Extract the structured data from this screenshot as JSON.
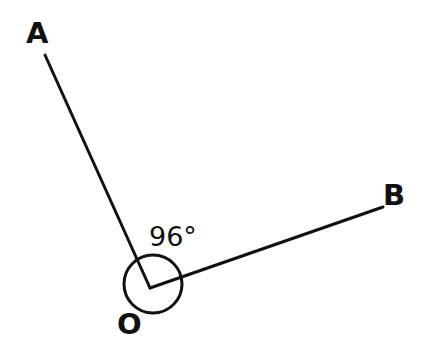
{
  "figure": {
    "background_color": "#ffffff",
    "stroke_color": "#111111",
    "stroke_width": 3,
    "width": 427,
    "height": 362
  },
  "labels": {
    "point_a": "A",
    "point_b": "B",
    "vertex_o": "O",
    "angle_measure": "96°"
  },
  "chart_data": {
    "type": "diagram",
    "subtype": "angle",
    "angle_degrees": 96,
    "angle_label": "96°",
    "vertex": {
      "name": "O",
      "x": 150,
      "y": 288
    },
    "points": [
      {
        "name": "A",
        "x": 45,
        "y": 55,
        "label_x": 33,
        "label_y": 38
      },
      {
        "name": "B",
        "x": 383,
        "y": 207,
        "label_x": 392,
        "label_y": 198
      }
    ],
    "rays": [
      {
        "name": "OA",
        "from": "O",
        "to": "A",
        "x1": 150,
        "y1": 288,
        "x2": 45,
        "y2": 55
      },
      {
        "name": "OB",
        "from": "O",
        "to": "B",
        "x1": 150,
        "y1": 288,
        "x2": 383,
        "y2": 207
      }
    ],
    "vertex_marker": {
      "shape": "circle",
      "cx": 153,
      "cy": 284,
      "r": 29,
      "filled": false
    },
    "angle_label_position": {
      "x": 150,
      "y": 223
    },
    "grid": false,
    "legend": "none"
  }
}
